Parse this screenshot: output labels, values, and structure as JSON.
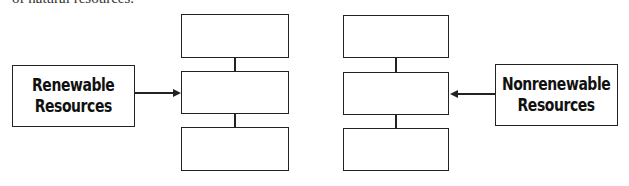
{
  "header": {
    "clipped_text": "of natural resources."
  },
  "left_label": {
    "line1": "Renewable",
    "line2": "Resources"
  },
  "right_label": {
    "line1": "Nonrenewable",
    "line2": "Resources"
  },
  "left_column": {
    "boxes": [
      "",
      "",
      ""
    ]
  },
  "right_column": {
    "boxes": [
      "",
      "",
      ""
    ]
  }
}
